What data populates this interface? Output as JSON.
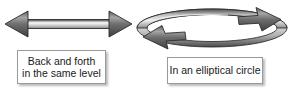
{
  "figure": {
    "background_color": "#ffffff",
    "arrow_colors": {
      "edge_dark": "#3a3a3a",
      "mid_light": "#e8e8e8",
      "body_grey": "#9b9b9b",
      "outline": "#2b2b2b"
    },
    "caption_border_color": "#9a9a9a",
    "caption_text_color": "#1a1a1a"
  },
  "shapes": [
    {
      "name": "double-headed-arrow",
      "type": "bidirectional-straight-arrow",
      "orientation": "horizontal",
      "heads": [
        "left",
        "right"
      ]
    },
    {
      "name": "elliptical-loop-arrow",
      "type": "circular-loop-arrow",
      "orientation": "ellipse",
      "direction": "clockwise",
      "heads": [
        "top-right",
        "bottom-left"
      ]
    }
  ],
  "captions": {
    "left": {
      "line1": "Back and forth",
      "line2": "in the same level"
    },
    "right": {
      "line1": "In an elliptical circle"
    }
  }
}
